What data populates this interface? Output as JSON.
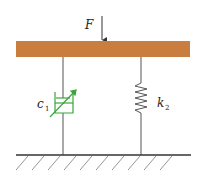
{
  "diagram": {
    "type": "mechanical-model",
    "force": {
      "label": "F",
      "direction": "down"
    },
    "damper": {
      "label": "c",
      "subscript": "1",
      "variable": true,
      "color": "#3aa43a"
    },
    "spring": {
      "label": "k",
      "subscript": "2",
      "color": "#555555"
    },
    "bar_color": "#c97d3f",
    "ground_color": "#333333"
  }
}
